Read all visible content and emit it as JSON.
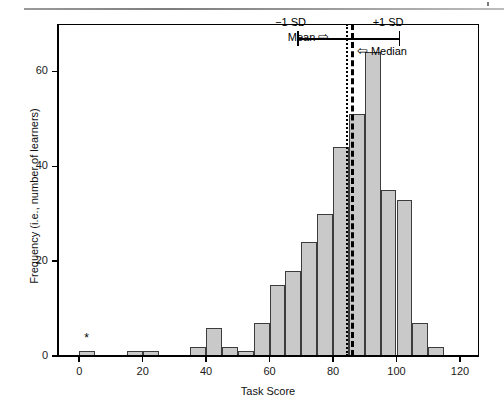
{
  "figure": {
    "background": "#ffffff",
    "bar_fill": "#c9c9c9",
    "bar_stroke": "#3c3c3c",
    "star_marker": "*"
  },
  "annotations": {
    "mean_label": "Mean",
    "mean_arrow": "⇨",
    "median_label": "Median",
    "median_arrow": "⇦",
    "sd_low_label": "−1 SD",
    "sd_high_label": "+1 SD"
  },
  "chart_data": {
    "type": "bar",
    "title": "",
    "xlabel": "Task Score",
    "ylabel": "Frequency (i.e., number of learners)",
    "xlim": [
      -7,
      126
    ],
    "ylim": [
      0,
      70
    ],
    "xticks": [
      0,
      20,
      40,
      60,
      80,
      100,
      120
    ],
    "xtick_labels": [
      "0",
      "20",
      "40",
      "60",
      "80",
      "100",
      "120"
    ],
    "yticks": [
      0,
      20,
      40,
      60
    ],
    "ytick_labels": [
      "0",
      "20",
      "40",
      "60"
    ],
    "grid": false,
    "legend": "none",
    "bin_width": 5,
    "bin_starts": [
      0,
      15,
      20,
      35,
      40,
      45,
      50,
      55,
      60,
      65,
      70,
      75,
      80,
      85,
      90,
      95,
      100,
      105,
      110
    ],
    "values": [
      1,
      1,
      1,
      2,
      6,
      2,
      1,
      7,
      15,
      18,
      24,
      30,
      44,
      51,
      64,
      35,
      33,
      7,
      2
    ],
    "markers": [
      {
        "label": "*",
        "x": 2.5,
        "y": 4
      }
    ],
    "reference_lines": [
      {
        "name": "mean",
        "x": 84.0,
        "style": "dotted"
      },
      {
        "name": "median",
        "x": 85.6,
        "style": "dashed"
      }
    ],
    "interval": {
      "name": "one_sd",
      "low": 69.0,
      "high": 101.0,
      "y": 67.0
    }
  }
}
